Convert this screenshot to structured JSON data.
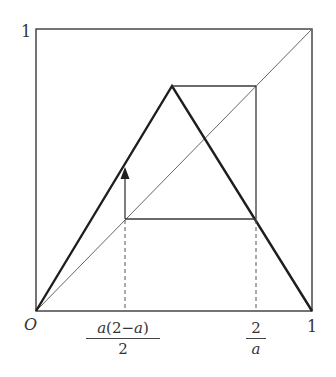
{
  "figure": {
    "type": "cobweb-diagram",
    "axes": {
      "origin_label": "O",
      "x_end_label": "1",
      "y_end_label": "1"
    },
    "x_ticks": [
      {
        "numerator": "a(2−a)",
        "denominator": "2",
        "position": 0.3234
      },
      {
        "numerator": "2",
        "denominator": "a",
        "position": 0.7935
      }
    ],
    "labels": {
      "origin": "O",
      "x_one": "1",
      "y_one": "1",
      "tick1_num_a1": "a",
      "tick1_num_rest": "(2−",
      "tick1_num_a2": "a",
      "tick1_num_close": ")",
      "tick1_den": "2",
      "tick2_num": "2",
      "tick2_den": "a"
    },
    "tent_peak": {
      "x": 0.495,
      "y": 0.787
    },
    "orbit": {
      "low_point": {
        "x": 0.3234,
        "y": 0.3234
      },
      "high_point": {
        "x": 0.7935,
        "y": 0.7935
      }
    },
    "colors": {
      "frame": "#3a3a3a",
      "tent": "#1e1e1e",
      "diagonal": "#666666",
      "cobweb": "#3a3a3a",
      "dashed": "#555555",
      "text": "#333333"
    }
  }
}
